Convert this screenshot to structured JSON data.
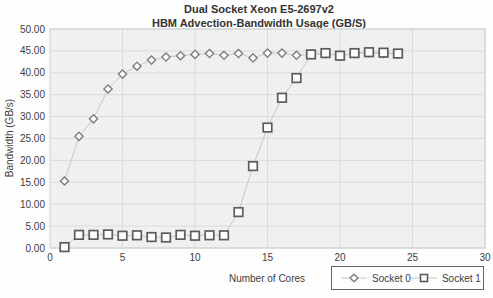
{
  "chart_data": {
    "type": "line",
    "title_line1": "Dual Socket Xeon E5-2697v2",
    "title_line2": "HBM Advection-Bandwidth Usage (GB/S)",
    "xlabel": "Number of Cores",
    "ylabel": "Bandwidth (GB/s)",
    "xlim": [
      0,
      30
    ],
    "ylim": [
      0,
      50
    ],
    "xtick_step": 5,
    "ytick_step": 5,
    "ytick_decimals": 2,
    "grid": true,
    "legend_position": "bottom-right",
    "x": [
      1,
      2,
      3,
      4,
      5,
      6,
      7,
      8,
      9,
      10,
      11,
      12,
      13,
      14,
      15,
      16,
      17,
      18,
      19,
      20,
      21,
      22,
      23,
      24
    ],
    "series": [
      {
        "name": "Socket 0",
        "marker": "diamond",
        "marker_color": "#7d7d7d",
        "line_color": "#c4c8c7",
        "values": [
          15.3,
          25.5,
          29.5,
          36.3,
          39.7,
          41.5,
          42.9,
          43.6,
          43.9,
          44.2,
          44.4,
          44.0,
          44.4,
          43.4,
          44.5,
          44.5,
          44.0,
          44.2,
          44.4,
          43.9,
          44.4,
          44.6,
          44.4,
          44.3
        ]
      },
      {
        "name": "Socket 1",
        "marker": "square",
        "marker_color": "#5c5c5c",
        "line_color": "#c4c8c7",
        "values": [
          0.2,
          3.0,
          3.0,
          3.1,
          2.8,
          2.9,
          2.5,
          2.4,
          3.0,
          2.8,
          2.9,
          2.9,
          8.2,
          18.7,
          27.5,
          34.3,
          38.8,
          44.2,
          44.5,
          43.9,
          44.5,
          44.7,
          44.6,
          44.4
        ]
      }
    ],
    "colors": {
      "plot_bg": "#f1f2f1",
      "plot_bg_alt": "#edefee",
      "grid": "#d9dcdb",
      "border": "#cdd0cf",
      "text": "#3e3e3e"
    }
  }
}
